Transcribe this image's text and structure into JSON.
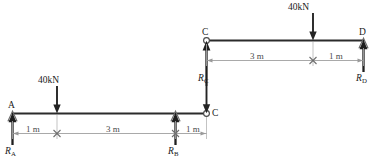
{
  "figure": {
    "type": "structural-beam-diagram",
    "background_color": "#ffffff",
    "beam_color": "#2b2b2b",
    "dimension_color": "#9a9a9a",
    "load_color": "#242424"
  },
  "upper_beam": {
    "name": "beam-CD",
    "left_node": {
      "label": "C",
      "support": "hinge-circle"
    },
    "right_node": {
      "label": "D",
      "support": "triangle-pin"
    },
    "load": {
      "label": "40kN",
      "value": 40,
      "unit": "kN",
      "direction": "down"
    },
    "reactions": [
      {
        "label": "R",
        "subscript": "C",
        "direction": "up"
      },
      {
        "label": "R",
        "subscript": "D",
        "direction": "up"
      }
    ],
    "dimensions": [
      {
        "label": "3 m",
        "value": 3,
        "unit": "m",
        "from": "C",
        "to": "load"
      },
      {
        "label": "1 m",
        "value": 1,
        "unit": "m",
        "from": "load",
        "to": "D"
      }
    ]
  },
  "lower_beam": {
    "name": "beam-AC",
    "left_node": {
      "label": "A",
      "support": "triangle-pin"
    },
    "right_node": {
      "label": "C",
      "support": "hinge-circle"
    },
    "load": {
      "label": "40kN",
      "value": 40,
      "unit": "kN",
      "direction": "down"
    },
    "reactions": [
      {
        "label": "R",
        "subscript": "A",
        "direction": "up"
      },
      {
        "label": "R",
        "subscript": "B",
        "direction": "up"
      },
      {
        "label": "R",
        "subscript": "C",
        "direction": "down"
      }
    ],
    "dimensions": [
      {
        "label": "1 m",
        "value": 1,
        "unit": "m",
        "from": "A",
        "to": "load"
      },
      {
        "label": "3 m",
        "value": 3,
        "unit": "m",
        "from": "load",
        "to": "B"
      },
      {
        "label": "1 m",
        "value": 1,
        "unit": "m",
        "from": "B",
        "to": "C"
      }
    ]
  },
  "labels": {
    "node_A": "A",
    "node_B_reaction": "R",
    "node_B_sub": "B",
    "node_C_upper": "C",
    "node_C_lower": "C",
    "node_D": "D",
    "load_upper": "40kN",
    "load_lower": "40kN",
    "rxn_A": "R",
    "rxn_A_sub": "A",
    "rxn_C_upper": "R",
    "rxn_C_upper_sub": "C",
    "rxn_D": "R",
    "rxn_D_sub": "D",
    "dim_upper_1": "3 m",
    "dim_upper_2": "1 m",
    "dim_lower_1": "1 m",
    "dim_lower_2": "3 m",
    "dim_lower_3": "1 m"
  }
}
